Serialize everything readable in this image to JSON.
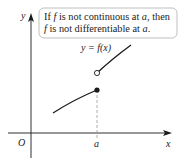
{
  "callout": {
    "line1_parts": [
      "If ",
      "f",
      " is not continuous at ",
      "a",
      ", then"
    ],
    "line2_parts": [
      "f",
      " is not differentiable at ",
      "a",
      "."
    ]
  },
  "labels": {
    "y_axis": "y",
    "x_axis": "x",
    "origin": "O",
    "a_tick": "a",
    "function_label": "y = f(x)"
  },
  "colors": {
    "curve": "#1a1a1a",
    "axis": "#1a1a1a",
    "callout_border": "#b8b8b8",
    "dashed": "#999999"
  }
}
